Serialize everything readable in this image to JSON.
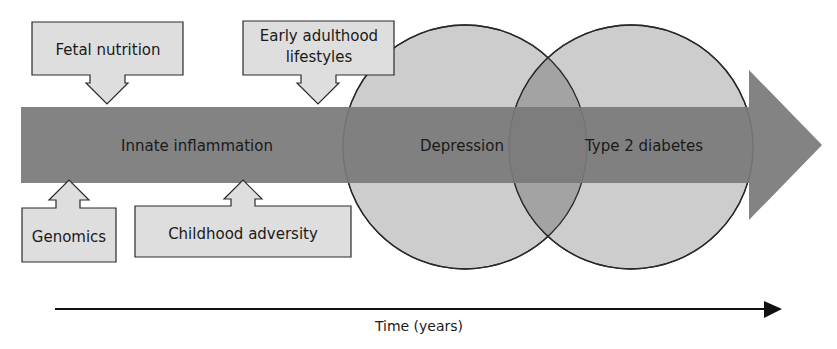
{
  "diagram": {
    "band_label": "Innate inflammation",
    "circles": [
      {
        "id": "depression",
        "label": "Depression"
      },
      {
        "id": "t2d",
        "label": "Type 2 diabetes"
      }
    ],
    "factors_above": [
      {
        "id": "fetal",
        "label": "Fetal nutrition"
      },
      {
        "id": "early",
        "label_line1": "Early adulthood",
        "label_line2": "lifestyles"
      }
    ],
    "factors_below": [
      {
        "id": "genomics",
        "label": "Genomics"
      },
      {
        "id": "childhood",
        "label": "Childhood adversity"
      }
    ],
    "axis_label": "Time (years)",
    "colors": {
      "band": "#7a7a7a",
      "circle": "#cdcdcd",
      "overlap": "#a3a3a3",
      "box": "#dedede",
      "stroke": "#2a2a2a"
    }
  }
}
